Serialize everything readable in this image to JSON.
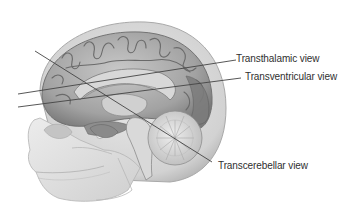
{
  "figure": {
    "colors": {
      "background": "#ffffff",
      "skull_shell": "#d6d6d6",
      "skull_edge": "#a8a8a8",
      "cortex": "#9c9c9c",
      "cortex_light": "#c4c4c4",
      "cortex_dark": "#6e6e6e",
      "bone_face": "#e4e4e4",
      "line": "#444444",
      "text": "#2f2f2f"
    },
    "planes": [
      {
        "id": "transthalamic",
        "label": "Transthalamic view"
      },
      {
        "id": "transventricular",
        "label": "Transventricular view"
      },
      {
        "id": "transcerebellar",
        "label": "Transcerebellar view"
      }
    ]
  }
}
